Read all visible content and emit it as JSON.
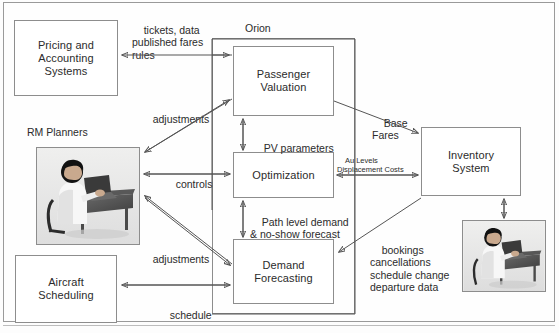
{
  "diagram": {
    "group": {
      "label": "Orion"
    },
    "boxes": {
      "pricing": "Pricing and\nAccounting\nSystems",
      "pricing_lines": [
        "Pricing and",
        "Accounting",
        "Systems"
      ],
      "rm_planners_label": "RM Planners",
      "aircraft": "Aircraft\nScheduling",
      "aircraft_lines": [
        "Aircraft",
        "Scheduling"
      ],
      "passenger_valuation_lines": [
        "Passenger",
        "Valuation"
      ],
      "optimization": "Optimization",
      "demand_forecasting_lines": [
        "Demand",
        "Forecasting"
      ],
      "inventory_lines": [
        "Inventory",
        "System"
      ]
    },
    "edge_labels": {
      "tickets": "tickets, data\npublished fares\nrules",
      "adjustments_top": "adjustments",
      "controls": "controls",
      "adjustments_bottom": "adjustments",
      "schedule": "schedule",
      "pv_parameters": "PV parameters",
      "path_level": "Path level demand\n& no-show forecast",
      "base_fares": "Base\nFares",
      "au_levels": "Au Levels\nDisplacement Costs",
      "bookings": "bookings\ncancellations\nschedule change\ndeparture data"
    },
    "colors": {
      "stroke": "#8d8d8d",
      "wire": "#555555",
      "text": "#2b2b2b",
      "background": "#fdfdfd"
    }
  }
}
